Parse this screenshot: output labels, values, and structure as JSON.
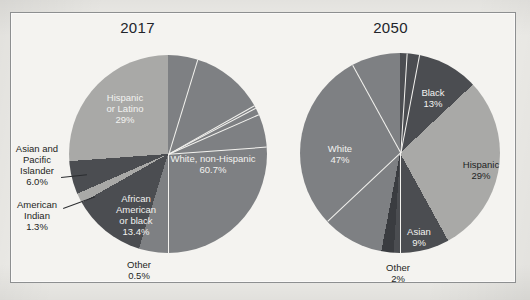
{
  "figure": {
    "background_color": "#efeeea",
    "panel_color": "#f4f3f0",
    "border_color": "#8d8f90"
  },
  "palette": {
    "light_gray": "#a9a9a7",
    "medium_gray": "#7e8083",
    "dark_gray": "#4b4d51",
    "very_dark_gray": "#3a3c40",
    "label_light": "#f2f2f0",
    "label_dark": "#1d1f23"
  },
  "panels": [
    {
      "key": "p2017",
      "title": "2017",
      "labels": {
        "white": "White, non-Hispanic\n60.7%",
        "hispanic": "Hispanic\nor Latino\n29%",
        "asian": "Asian and\nPacific\nIslander\n6.0%",
        "american_indian": "American\nIndian\n1.3%",
        "african_american": "African\nAmerican\nor black\n13.4%",
        "other": "Other\n0.5%"
      }
    },
    {
      "key": "p2050",
      "title": "2050",
      "labels": {
        "white": "White\n47%",
        "black": "Black\n13%",
        "hispanic": "Hispanic\n29%",
        "asian": "Asian\n9%",
        "other": "Other\n2%"
      }
    }
  ],
  "chart_data": [
    {
      "type": "pie",
      "title": "2017",
      "categories": [
        "White, non-Hispanic",
        "African American or black",
        "Other",
        "American Indian",
        "Asian and Pacific Islander",
        "Hispanic or Latino"
      ],
      "values": [
        60.7,
        13.4,
        0.5,
        1.3,
        6.0,
        29.0
      ],
      "value_labels": [
        "60.7%",
        "13.4%",
        "0.5%",
        "1.3%",
        "6.0%",
        "29%"
      ],
      "colors": [
        "#7e8083",
        "#4b4d51",
        "#a9a9a7",
        "#a9a9a7",
        "#4b4d51",
        "#a9a9a7"
      ],
      "legend": "none",
      "start_angle_deg": 0,
      "direction": "clockwise"
    },
    {
      "type": "pie",
      "title": "2050",
      "categories": [
        "Black",
        "Hispanic",
        "Asian",
        "Other",
        "White"
      ],
      "values": [
        13,
        29,
        9,
        2,
        47
      ],
      "value_labels": [
        "13%",
        "29%",
        "9%",
        "2%",
        "47%"
      ],
      "colors": [
        "#4b4d51",
        "#a9a9a7",
        "#4b4d51",
        "#3a3c40",
        "#7e8083"
      ],
      "legend": "none",
      "start_angle_deg": 0,
      "direction": "clockwise"
    }
  ]
}
